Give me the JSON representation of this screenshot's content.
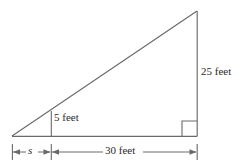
{
  "figure": {
    "kind": "right-triangle-geometry-diagram",
    "stroke_color": "#6a6a6a",
    "text_color": "#2b2b2b",
    "background_color": "#ffffff",
    "labels": {
      "vertical_right": "25 feet",
      "vertical_inner": "5 feet",
      "base_long": "30 feet",
      "base_short": "s"
    },
    "geometry": {
      "left_vertex": [
        12,
        136
      ],
      "apex": [
        197,
        11
      ],
      "right_angle_vertex": [
        197,
        136
      ],
      "inner_segment_x": 51,
      "inner_segment_top_y": 111,
      "baseline_y": 136,
      "dimension_line_y": 152,
      "dimension_ticks_x": [
        12,
        51,
        197
      ],
      "right_angle_marker_size": 15
    }
  }
}
